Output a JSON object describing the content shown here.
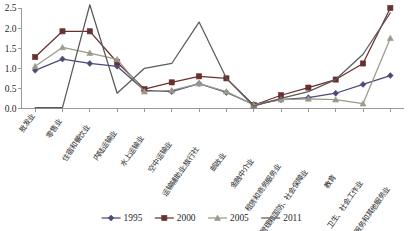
{
  "chart_data": {
    "type": "line",
    "title": "",
    "xlabel": "",
    "ylabel": "",
    "ylim": [
      0.0,
      2.5
    ],
    "ytick_labels": [
      "0.0",
      "0.5",
      "1.0",
      "1.5",
      "2.0",
      "2.5"
    ],
    "ytick_values": [
      0.0,
      0.5,
      1.0,
      1.5,
      2.0,
      2.5
    ],
    "grid": false,
    "legend_position": "bottom",
    "categories": [
      "批发业",
      "零售业",
      "住宿和餐饮业",
      "内陆运输业",
      "水上运输业",
      "空中运输业",
      "运输辅助业;旅行社",
      "邮政业",
      "金融中介业",
      "租赁和商务服务业",
      "公共管理和国防、社会保障业",
      "教育",
      "卫生、社会工作业",
      "居民服务和其他服务业"
    ],
    "series": [
      {
        "name": "1995",
        "color": "#4a4a7a",
        "marker": "diamond",
        "values": [
          0.95,
          1.23,
          1.12,
          1.05,
          0.45,
          0.42,
          0.62,
          0.4,
          0.1,
          0.22,
          0.27,
          0.38,
          0.6,
          0.82
        ]
      },
      {
        "name": "2000",
        "color": "#6b2f2f",
        "marker": "square",
        "values": [
          1.28,
          1.92,
          1.92,
          1.15,
          0.48,
          0.65,
          0.8,
          0.75,
          0.08,
          0.33,
          0.52,
          0.72,
          1.12,
          2.5
        ]
      },
      {
        "name": "2005",
        "color": "#9a9a8a",
        "marker": "triangle",
        "values": [
          1.05,
          1.52,
          1.38,
          1.22,
          0.42,
          0.45,
          0.62,
          0.42,
          0.09,
          0.22,
          0.24,
          0.22,
          0.12,
          1.75
        ]
      },
      {
        "name": "2011",
        "color": "#5a5a5a",
        "marker": "none",
        "values": [
          0.02,
          0.02,
          2.58,
          0.38,
          1.0,
          1.12,
          2.15,
          0.75,
          0.06,
          0.25,
          0.42,
          0.72,
          1.35,
          2.38
        ]
      }
    ]
  },
  "legend": {
    "items": [
      {
        "label": "1995"
      },
      {
        "label": "2000"
      },
      {
        "label": "2005"
      },
      {
        "label": "2011"
      }
    ]
  }
}
